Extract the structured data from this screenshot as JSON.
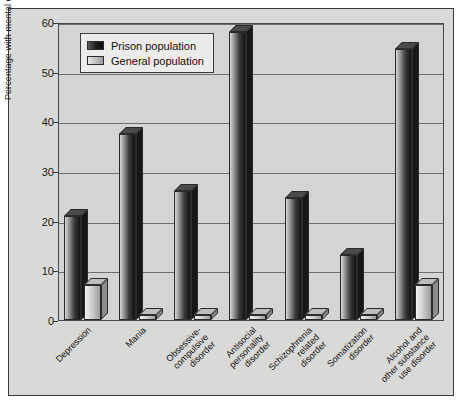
{
  "chart_data": {
    "type": "bar",
    "title": "",
    "xlabel": "",
    "ylabel": "Percentage with mental disorder",
    "ylim": [
      0,
      60
    ],
    "yticks": [
      0,
      10,
      20,
      30,
      40,
      50,
      60
    ],
    "grid": true,
    "legend_position": "top-left inside plot",
    "style": "3D grayscale bars",
    "categories": [
      "Depression",
      "Mania",
      "Obsessive-\ncompulsive\ndisorder",
      "Antisocial\npersonality\ndisorder",
      "Schizophrenia\nrelated\ndisorder",
      "Somatization\ndisorder",
      "Alcohol and\nother substance\nuse disorder"
    ],
    "series": [
      {
        "name": "Prison population",
        "color": "#1a1a1a",
        "values": [
          21,
          37.5,
          26,
          58,
          24.5,
          13,
          54.5
        ]
      },
      {
        "name": "General population",
        "color": "#c2c2c0",
        "values": [
          7,
          1,
          1,
          1,
          1,
          1,
          7
        ]
      }
    ]
  },
  "legend": {
    "items": [
      {
        "label": "Prison population",
        "swatch": "prison"
      },
      {
        "label": "General population",
        "swatch": "general"
      }
    ]
  }
}
